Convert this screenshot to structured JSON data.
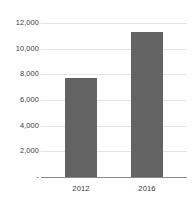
{
  "chart_data": {
    "type": "bar",
    "title": "",
    "subtitle": "",
    "xlabel": "",
    "ylabel": "",
    "categories": [
      "2012",
      "2016"
    ],
    "values": [
      7700,
      11300
    ],
    "series": [
      {
        "name": "",
        "values": [
          7700,
          11300
        ]
      }
    ],
    "ylim": [
      0,
      12000
    ],
    "ytick_values": [
      0,
      2000,
      4000,
      6000,
      8000,
      10000,
      12000
    ],
    "ytick_labels": [
      "-",
      "2,000",
      "4,000",
      "6,000",
      "8,000",
      "10,000",
      "12,000"
    ],
    "grid": true,
    "legend": false,
    "legend_position": "none",
    "bar_color": "#636363",
    "gridline_color": "#e4e4e4",
    "axis_color": "#8a8a8a",
    "text_color": "#3a3a3a",
    "background_color": "#ffffff"
  },
  "axis": {
    "y_labels": [
      {
        "text": "12,000",
        "value": 12000
      },
      {
        "text": "10,000",
        "value": 10000
      },
      {
        "text": "8,000",
        "value": 8000
      },
      {
        "text": "6,000",
        "value": 6000
      },
      {
        "text": "4,000",
        "value": 4000
      },
      {
        "text": "2,000",
        "value": 2000
      },
      {
        "text": "-",
        "value": 0
      }
    ],
    "x_labels": [
      {
        "text": "2012"
      },
      {
        "text": "2016"
      }
    ]
  }
}
